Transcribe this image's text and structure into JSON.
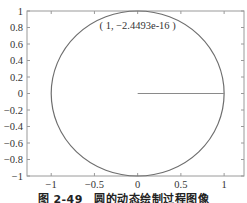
{
  "chart_data": {
    "type": "line",
    "title": "",
    "xlabel": "",
    "ylabel": "",
    "xlim": [
      -1.28,
      1.23
    ],
    "ylim": [
      -1,
      1
    ],
    "grid": false,
    "legend": null,
    "x_ticks": [
      -1,
      -0.5,
      0,
      0.5,
      1
    ],
    "x_tick_labels": [
      "-1",
      "-0.5",
      "0",
      "0.5",
      "1"
    ],
    "y_ticks": [
      1,
      0.8,
      0.6,
      0.4,
      0.2,
      0,
      -0.2,
      -0.4,
      -0.6,
      -0.8,
      -1
    ],
    "y_tick_labels": [
      "1",
      "0.8",
      "0.6",
      "0.4",
      "0.2",
      "0",
      "-0.2",
      "-0.4",
      "-0.6",
      "-0.8",
      "-1"
    ],
    "series": [
      {
        "name": "circle",
        "shape": "unit circle x=cos(t), y=sin(t), t in [0, 2π]",
        "center": [
          0,
          0
        ],
        "radius": 1,
        "color": "#6e6e6e"
      },
      {
        "name": "radius line",
        "x": [
          0,
          1
        ],
        "y": [
          0,
          0
        ],
        "color": "#8a8a8a"
      }
    ],
    "annotations": [
      {
        "text": "( 1, -2.4493e-16 )",
        "x": 0.0,
        "y": 0.82
      }
    ]
  },
  "caption": "图 2-49　圆的动态绘制过程图像",
  "colors": {
    "axes": "#9a9a9a",
    "curve": "#6e6e6e",
    "text": "#333333"
  }
}
